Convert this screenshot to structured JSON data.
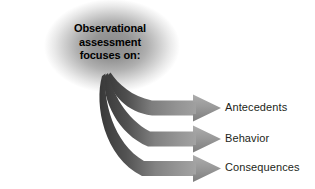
{
  "diagram": {
    "type": "fan-out-arrow-diagram",
    "title": "Observational assessment focuses on:",
    "heading_lines": [
      "Observational",
      "assessment",
      "focuses on:"
    ],
    "source_node": {
      "name": "observational-assessment-source",
      "label": "Observational assessment focuses on:",
      "glow_color": "#9a9a9a",
      "text_color": "#000000"
    },
    "arrows": [
      {
        "id": "arrow-antecedents",
        "label": "Antecedents",
        "tail_color": "#3d3d3d",
        "head_color": "#9b9b9b",
        "order": 1
      },
      {
        "id": "arrow-behavior",
        "label": "Behavior",
        "tail_color": "#3d3d3d",
        "head_color": "#9b9b9b",
        "order": 2
      },
      {
        "id": "arrow-consequences",
        "label": "Consequences",
        "tail_color": "#3d3d3d",
        "head_color": "#9b9b9b",
        "order": 3
      }
    ],
    "labels": {
      "antecedents": "Antecedents",
      "behavior": "Behavior",
      "consequences": "Consequences"
    },
    "colors": {
      "background": "#ffffff",
      "text": "#231f20",
      "heading_text": "#000000",
      "arrow_dark": "#3d3d3d",
      "arrow_mid": "#777777",
      "arrow_light": "#a5a5a5",
      "glow_center": "#8f8f8f"
    }
  }
}
